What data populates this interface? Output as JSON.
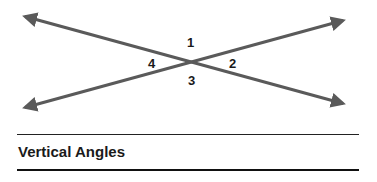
{
  "diagram": {
    "title": "Vertical Angles",
    "line_color": "#5a5a5a",
    "lines": [
      {
        "name": "line-a",
        "from": [
          23,
          16
        ],
        "to": [
          345,
          104
        ]
      },
      {
        "name": "line-b",
        "from": [
          23,
          108
        ],
        "to": [
          345,
          20
        ]
      }
    ],
    "intersection": [
      191,
      62
    ],
    "angles": [
      {
        "label": "1",
        "position": "top"
      },
      {
        "label": "2",
        "position": "right"
      },
      {
        "label": "3",
        "position": "bottom"
      },
      {
        "label": "4",
        "position": "left"
      }
    ]
  }
}
